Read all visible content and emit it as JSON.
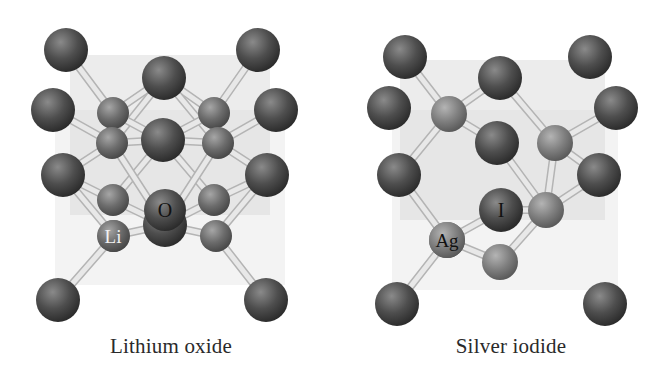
{
  "figure": {
    "panels": [
      {
        "id": "lithium-oxide",
        "caption": "Lithium oxide",
        "atom_labels": {
          "anion": "O",
          "cation": "Li"
        },
        "cube": {
          "back_face": [
            [
              70,
              55
            ],
            [
              270,
              55
            ],
            [
              270,
              215
            ],
            [
              70,
              215
            ]
          ],
          "front_face": [
            [
              55,
              110
            ],
            [
              285,
              110
            ],
            [
              285,
              285
            ],
            [
              55,
              285
            ]
          ]
        },
        "large_atoms": [
          [
            66,
            50
          ],
          [
            258,
            50
          ],
          [
            164,
            78
          ],
          [
            53,
            110
          ],
          [
            276,
            110
          ],
          [
            163,
            140
          ],
          [
            63,
            175
          ],
          [
            267,
            175
          ],
          [
            165,
            225
          ],
          [
            58,
            300
          ],
          [
            266,
            300
          ]
        ],
        "small_atoms": [
          [
            113,
            113
          ],
          [
            214,
            113
          ],
          [
            112,
            143
          ],
          [
            218,
            143
          ],
          [
            113,
            200
          ],
          [
            214,
            200
          ],
          [
            114,
            236
          ],
          [
            216,
            236
          ]
        ],
        "bonds": [
          [
            [
              66,
              50
            ],
            [
              113,
              113
            ]
          ],
          [
            [
              258,
              50
            ],
            [
              214,
              113
            ]
          ],
          [
            [
              164,
              78
            ],
            [
              113,
              113
            ]
          ],
          [
            [
              164,
              78
            ],
            [
              214,
              113
            ]
          ],
          [
            [
              164,
              78
            ],
            [
              112,
              143
            ]
          ],
          [
            [
              164,
              78
            ],
            [
              218,
              143
            ]
          ],
          [
            [
              53,
              110
            ],
            [
              112,
              143
            ]
          ],
          [
            [
              276,
              110
            ],
            [
              218,
              143
            ]
          ],
          [
            [
              163,
              140
            ],
            [
              112,
              143
            ]
          ],
          [
            [
              163,
              140
            ],
            [
              218,
              143
            ]
          ],
          [
            [
              163,
              140
            ],
            [
              113,
              200
            ]
          ],
          [
            [
              163,
              140
            ],
            [
              214,
              200
            ]
          ],
          [
            [
              112,
              143
            ],
            [
              63,
              175
            ]
          ],
          [
            [
              218,
              143
            ],
            [
              267,
              175
            ]
          ],
          [
            [
              112,
              143
            ],
            [
              165,
              225
            ]
          ],
          [
            [
              218,
              143
            ],
            [
              165,
              225
            ]
          ],
          [
            [
              63,
              175
            ],
            [
              113,
              200
            ]
          ],
          [
            [
              267,
              175
            ],
            [
              214,
              200
            ]
          ],
          [
            [
              165,
              225
            ],
            [
              114,
              236
            ]
          ],
          [
            [
              165,
              225
            ],
            [
              216,
              236
            ]
          ],
          [
            [
              58,
              300
            ],
            [
              114,
              236
            ]
          ],
          [
            [
              266,
              300
            ],
            [
              216,
              236
            ]
          ],
          [
            [
              113,
              113
            ],
            [
              163,
              140
            ]
          ],
          [
            [
              214,
              113
            ],
            [
              163,
              140
            ]
          ],
          [
            [
              113,
              200
            ],
            [
              165,
              225
            ]
          ],
          [
            [
              214,
              200
            ],
            [
              165,
              225
            ]
          ],
          [
            [
              63,
              175
            ],
            [
              114,
              236
            ]
          ],
          [
            [
              267,
              175
            ],
            [
              216,
              236
            ]
          ]
        ],
        "labeled": {
          "anion_atom": [
            165,
            210
          ],
          "cation_atom": [
            113,
            236
          ]
        }
      },
      {
        "id": "silver-iodide",
        "caption": "Silver iodide",
        "atom_labels": {
          "anion": "I",
          "cation": "Ag"
        },
        "cube": {
          "back_face": [
            [
              400,
              60
            ],
            [
              605,
              60
            ],
            [
              605,
              220
            ],
            [
              400,
              220
            ]
          ],
          "front_face": [
            [
              392,
              110
            ],
            [
              618,
              110
            ],
            [
              618,
              290
            ],
            [
              392,
              290
            ]
          ]
        },
        "large_atoms": [
          [
            405,
            57
          ],
          [
            590,
            57
          ],
          [
            500,
            78
          ],
          [
            389,
            108
          ],
          [
            616,
            108
          ],
          [
            497,
            143
          ],
          [
            399,
            175
          ],
          [
            599,
            175
          ],
          [
            501,
            210
          ],
          [
            397,
            304
          ],
          [
            605,
            304
          ]
        ],
        "small_atoms": [
          [
            449,
            114
          ],
          [
            555,
            143
          ],
          [
            447,
            240
          ],
          [
            546,
            210
          ],
          [
            500,
            262
          ]
        ],
        "bonds": [
          [
            [
              405,
              57
            ],
            [
              449,
              114
            ]
          ],
          [
            [
              500,
              78
            ],
            [
              449,
              114
            ]
          ],
          [
            [
              500,
              78
            ],
            [
              555,
              143
            ]
          ],
          [
            [
              616,
              108
            ],
            [
              555,
              143
            ]
          ],
          [
            [
              449,
              114
            ],
            [
              497,
              143
            ]
          ],
          [
            [
              449,
              114
            ],
            [
              399,
              175
            ]
          ],
          [
            [
              555,
              143
            ],
            [
              599,
              175
            ]
          ],
          [
            [
              555,
              143
            ],
            [
              546,
              210
            ]
          ],
          [
            [
              497,
              143
            ],
            [
              546,
              210
            ]
          ],
          [
            [
              399,
              175
            ],
            [
              447,
              240
            ]
          ],
          [
            [
              501,
              210
            ],
            [
              447,
              240
            ]
          ],
          [
            [
              501,
              210
            ],
            [
              546,
              210
            ]
          ],
          [
            [
              447,
              240
            ],
            [
              397,
              304
            ]
          ],
          [
            [
              447,
              240
            ],
            [
              500,
              262
            ]
          ],
          [
            [
              546,
              210
            ],
            [
              500,
              262
            ]
          ],
          [
            [
              599,
              175
            ],
            [
              546,
              210
            ]
          ]
        ],
        "labeled": {
          "anion_atom": [
            501,
            210
          ],
          "cation_atom": [
            447,
            240
          ]
        }
      }
    ],
    "colors": {
      "background": "#ffffff",
      "cube_face": "#dcdcdc",
      "large_atom": "#4a4a4a",
      "small_atom": "#7a7a7a",
      "bond": "#e8e8e8",
      "bond_edge": "#b4b4b4",
      "caption": "#2a2a2a"
    }
  }
}
